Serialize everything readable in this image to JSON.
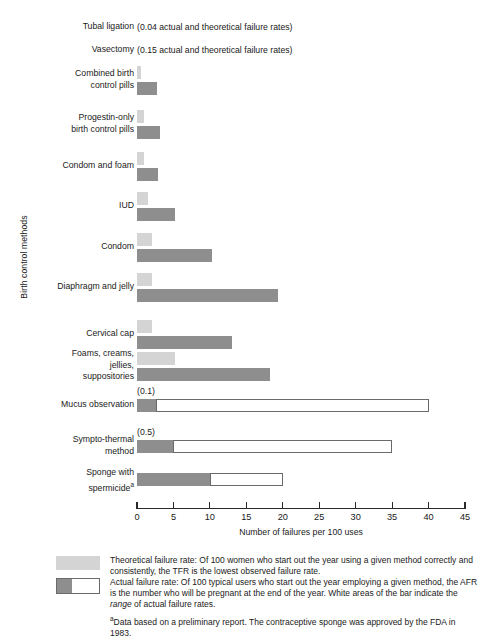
{
  "chart_data": {
    "type": "bar",
    "orientation": "horizontal",
    "title": "",
    "xlabel": "Number of failures per 100 uses",
    "ylabel": "Birth control methods",
    "xlim": [
      0,
      45
    ],
    "xticks": [
      0,
      5,
      10,
      15,
      20,
      25,
      30,
      35,
      40,
      45
    ],
    "grid": false,
    "legend_position": "below-axis",
    "series": [
      {
        "name": "Theoretical failure rate",
        "color": "#d4d4d4"
      },
      {
        "name": "Actual failure rate",
        "color": "#8e8e8e"
      },
      {
        "name": "Range of actual failure rates",
        "color": "#ffffff"
      }
    ],
    "categories": [
      "Tubal ligation",
      "Vasectomy",
      "Combined birth control pills",
      "Progestin-only birth control pills",
      "Condom and foam",
      "IUD",
      "Condom",
      "Diaphragm and jelly",
      "Cervical cap",
      "Foams, creams, jellies, suppositories",
      "Mucus observation",
      "Sympto-thermal method",
      "Sponge with spermicide"
    ],
    "rows": [
      {
        "label": "Tubal ligation",
        "note": "(0.04 actual and theoretical failure rates)",
        "theoretical": null,
        "actual": null,
        "range_end": null
      },
      {
        "label": "Vasectomy",
        "note": "(0.15 actual and theoretical failure rates)",
        "theoretical": null,
        "actual": null,
        "range_end": null
      },
      {
        "label": "Combined birth\ncontrol pills",
        "note": "",
        "theoretical": 0.5,
        "actual": 2.8,
        "range_end": null
      },
      {
        "label": "Progestin-only\nbirth control pills",
        "note": "",
        "theoretical": 1.0,
        "actual": 3.2,
        "range_end": null
      },
      {
        "label": "Condom and foam",
        "note": "",
        "theoretical": 1.0,
        "actual": 2.9,
        "range_end": null
      },
      {
        "label": "IUD",
        "note": "",
        "theoretical": 1.5,
        "actual": 5.2,
        "range_end": null
      },
      {
        "label": "Condom",
        "note": "",
        "theoretical": 2.0,
        "actual": 10.3,
        "range_end": null
      },
      {
        "label": "Diaphragm and jelly",
        "note": "",
        "theoretical": 2.0,
        "actual": 19.3,
        "range_end": null
      },
      {
        "label": "Cervical cap",
        "note": "",
        "theoretical": 2.0,
        "actual": 13.0,
        "range_end": null
      },
      {
        "label": "Foams, creams,\njellies,\nsuppositories",
        "note": "",
        "theoretical": 5.2,
        "actual": 18.2,
        "range_end": null
      },
      {
        "label": "Mucus observation",
        "note": "(0.1)",
        "theoretical": null,
        "actual": 2.6,
        "range_end": 40.0
      },
      {
        "label": "Sympto-thermal\nmethod",
        "note": "(0.5)",
        "theoretical": null,
        "actual": 5.0,
        "range_end": 35.0
      },
      {
        "label": "Sponge with\nspermicide",
        "note": "",
        "theoretical": null,
        "actual": 10.0,
        "range_end": 20.0,
        "superscript": "a"
      }
    ]
  },
  "axis": {
    "ticklabels": [
      "0",
      "5",
      "10",
      "15",
      "20",
      "25",
      "30",
      "35",
      "40",
      "45"
    ],
    "xtitle": "Number of failures per 100 uses",
    "ytitle": "Birth control methods"
  },
  "legend": {
    "theoretical_label": "Theoretical failure rate: Of 100 women who start out the year using a given method correctly and consistently, the TFR is the lowest observed failure rate.",
    "actual_label_part1": "Actual failure rate: Of 100 typical users who start out the year employing a given method, the AFR is the number who will be pregnant at the end of the year. White areas of the bar indicate the ",
    "actual_label_italic": "range",
    "actual_label_part2": " of actual failure rates."
  },
  "footnote": {
    "marker": "a",
    "text": "Data based on a preliminary report. The contraceptive sponge was approved by the FDA in 1983."
  },
  "row_labels": {
    "tubal_ligation": "Tubal ligation",
    "vasectomy": "Vasectomy",
    "combined_pills": "Combined birth\ncontrol pills",
    "progestin_pills": "Progestin-only\nbirth control pills",
    "condom_foam": "Condom and foam",
    "iud": "IUD",
    "condom": "Condom",
    "diaphragm": "Diaphragm and jelly",
    "cervical_cap": "Cervical cap",
    "foams": "Foams, creams,\njellies,\nsuppositories",
    "mucus": "Mucus observation",
    "sympto": "Sympto-thermal\nmethod",
    "sponge": "Sponge with\nspermicide"
  },
  "row_notes": {
    "tubal_ligation": "(0.04 actual and theoretical failure rates)",
    "vasectomy": "(0.15 actual and theoretical failure rates)",
    "mucus": "(0.1)",
    "sympto": "(0.5)"
  },
  "colors": {
    "theoretical": "#d4d4d4",
    "actual": "#8e8e8e",
    "range": "#ffffff",
    "axis": "#2a2a2a"
  }
}
